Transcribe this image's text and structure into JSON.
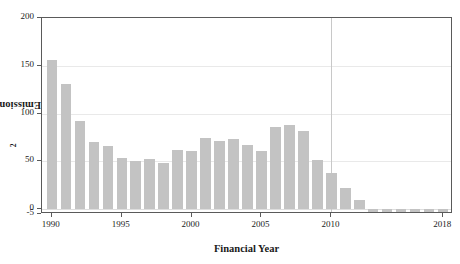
{
  "chart_data": {
    "type": "bar",
    "title": "",
    "xlabel": "Financial Year",
    "ylabel": "Emissions (Mt CO2-eq)",
    "ylabel_prefix": "Emissions (Mt CO",
    "ylabel_sub": "2",
    "ylabel_suffix": "-eq)",
    "xlim": [
      1989.3,
      2018.7
    ],
    "ylim": [
      -5,
      200
    ],
    "yticks": [
      -5,
      0,
      50,
      100,
      150,
      200
    ],
    "ytick_labels": [
      "-5",
      "0",
      "50",
      "100",
      "150",
      "200"
    ],
    "xticks": [
      1990,
      1995,
      2000,
      2005,
      2010,
      2018
    ],
    "xtick_labels": [
      "1990",
      "1995",
      "2000",
      "2005",
      "2010",
      "2018"
    ],
    "grid": "horizontal-light-plus-vertical-at-2010",
    "legend": "none",
    "bar_color": "#c3c3c3",
    "categories": [
      1990,
      1991,
      1992,
      1993,
      1994,
      1995,
      1996,
      1997,
      1998,
      1999,
      2000,
      2001,
      2002,
      2003,
      2004,
      2005,
      2006,
      2007,
      2008,
      2009,
      2010,
      2011,
      2012,
      2013,
      2014,
      2015,
      2016,
      2017,
      2018
    ],
    "values": [
      156,
      131,
      92,
      70,
      66,
      54,
      50,
      53,
      48,
      62,
      61,
      75,
      71,
      73,
      67,
      61,
      86,
      88,
      82,
      52,
      38,
      22,
      10,
      -13,
      -14,
      -4,
      -16,
      -16,
      -13
    ],
    "annotations": [
      {
        "type": "vertical-line",
        "x": 2010,
        "color": "#c8c8c8"
      }
    ]
  }
}
